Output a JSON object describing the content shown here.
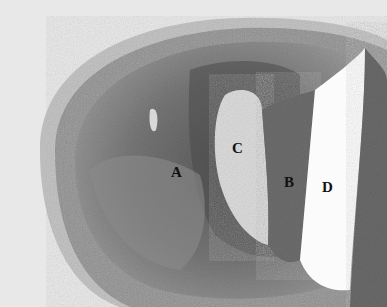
{
  "image": {
    "description": "Grayscale histology micrograph of arterial cross-section with lesion",
    "labels": [
      {
        "id": "A",
        "text": "A",
        "x": 171,
        "y": 165
      },
      {
        "id": "B",
        "text": "B",
        "x": 284,
        "y": 175
      },
      {
        "id": "C",
        "text": "C",
        "x": 232,
        "y": 141
      },
      {
        "id": "D",
        "text": "D",
        "x": 322,
        "y": 180
      }
    ]
  }
}
